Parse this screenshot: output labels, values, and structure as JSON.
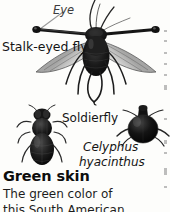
{
  "page": {
    "background_color": "#fdfdfb",
    "text_color": "#1b1b1b",
    "width": 170,
    "height": 212
  },
  "figure_labels": {
    "eye": "Eye",
    "stalk_eyed_fly": "Stalk-eyed fly",
    "soldierfly": "Soldierfly",
    "species_genus": "Celyphus",
    "species_epithet": "hyacinthus"
  },
  "illustrations": [
    {
      "name": "stalk-eyed-fly-illustration",
      "caption": "Stalk-eyed fly",
      "annotation": "Eye"
    },
    {
      "name": "soldierfly-illustration",
      "caption": "Soldierfly"
    },
    {
      "name": "celyphus-hyacinthus-illustration",
      "caption": "Celyphus hyacinthus"
    }
  ],
  "article": {
    "heading": "Green skin",
    "body_lines": [
      "The green color of",
      "this South American"
    ]
  }
}
